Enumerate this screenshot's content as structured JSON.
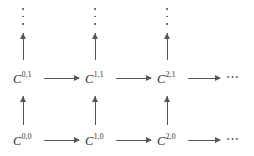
{
  "figure": {
    "kind": "commutative-diagram",
    "background_color": "#ffffff",
    "ink_color": "#56565a",
    "label_color": "#2b2b2b"
  },
  "nodes": [
    {
      "id": "c00",
      "base": "C",
      "sup": "0,0",
      "text": "C^{0,0}",
      "row": 0,
      "col": 0
    },
    {
      "id": "c10",
      "base": "C",
      "sup": "1,0",
      "text": "C^{1,0}",
      "row": 0,
      "col": 1
    },
    {
      "id": "c20",
      "base": "C",
      "sup": "2,0",
      "text": "C^{2,0}",
      "row": 0,
      "col": 2
    },
    {
      "id": "c01",
      "base": "C",
      "sup": "0,1",
      "text": "C^{0,1}",
      "row": 1,
      "col": 0
    },
    {
      "id": "c11",
      "base": "C",
      "sup": "1,1",
      "text": "C^{1,1}",
      "row": 1,
      "col": 1
    },
    {
      "id": "c21",
      "base": "C",
      "sup": "2,1",
      "text": "C^{2,1}",
      "row": 1,
      "col": 2
    }
  ],
  "row_continuations": [
    {
      "id": "dots-row0",
      "glyph": "⋯",
      "row": 0
    },
    {
      "id": "dots-row1",
      "glyph": "⋯",
      "row": 1
    }
  ],
  "column_continuations": [
    {
      "id": "vdots-col0",
      "glyph": "⋮",
      "col": 0
    },
    {
      "id": "vdots-col1",
      "glyph": "⋮",
      "col": 1
    },
    {
      "id": "vdots-col2",
      "glyph": "⋮",
      "col": 2
    }
  ],
  "horizontal_arrows": [
    {
      "id": "h-00-10",
      "from": "C^{0,0}",
      "to": "C^{1,0}",
      "direction": "right"
    },
    {
      "id": "h-10-20",
      "from": "C^{1,0}",
      "to": "C^{2,0}",
      "direction": "right"
    },
    {
      "id": "h-20-dots",
      "from": "C^{2,0}",
      "to": "⋯",
      "direction": "right"
    },
    {
      "id": "h-01-11",
      "from": "C^{0,1}",
      "to": "C^{1,1}",
      "direction": "right"
    },
    {
      "id": "h-11-21",
      "from": "C^{1,1}",
      "to": "C^{2,1}",
      "direction": "right"
    },
    {
      "id": "h-21-dots",
      "from": "C^{2,1}",
      "to": "⋯",
      "direction": "right"
    }
  ],
  "vertical_arrows": [
    {
      "id": "v-00-01",
      "from": "C^{0,0}",
      "to": "C^{0,1}",
      "direction": "up"
    },
    {
      "id": "v-10-11",
      "from": "C^{1,0}",
      "to": "C^{1,1}",
      "direction": "up"
    },
    {
      "id": "v-20-21",
      "from": "C^{2,0}",
      "to": "C^{2,1}",
      "direction": "up"
    },
    {
      "id": "v-01-dots",
      "from": "C^{0,1}",
      "to": "⋮",
      "direction": "up"
    },
    {
      "id": "v-11-dots",
      "from": "C^{1,1}",
      "to": "⋮",
      "direction": "up"
    },
    {
      "id": "v-21-dots",
      "from": "C^{2,1}",
      "to": "⋮",
      "direction": "up"
    }
  ]
}
